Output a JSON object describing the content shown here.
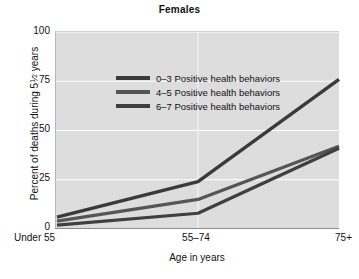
{
  "chart_data": {
    "type": "line",
    "title": "Females",
    "xlabel": "Age in years",
    "ylabel": "Percent of deaths during 5 1/2 years",
    "ylabel_prefix": "Percent of deaths during 5",
    "ylabel_frac_num": "1",
    "ylabel_frac_den": "2",
    "ylabel_suffix": " years",
    "categories": [
      "Under 55",
      "55–74",
      "75+"
    ],
    "ylim": [
      0,
      100
    ],
    "yticks": [
      0,
      25,
      50,
      75,
      100
    ],
    "ytick_labels": [
      "0",
      "25",
      "50",
      "75",
      "100"
    ],
    "grid": "horizontal-white",
    "legend_position": "upper-left-inside",
    "series": [
      {
        "name": "0–3 Positive health behaviors",
        "color": "#3a3a3a",
        "values": [
          6,
          24,
          76
        ]
      },
      {
        "name": "4–5 Positive health behaviors",
        "color": "#555555",
        "values": [
          4,
          15,
          42
        ]
      },
      {
        "name": "6–7 Positive health behaviors",
        "color": "#3f3f3f",
        "values": [
          2,
          8,
          41
        ]
      }
    ]
  },
  "style": {
    "plot_background": "#dddddd",
    "gridline_color": "#ffffff",
    "axis_color": "#8c8c8c",
    "text_color": "#111111",
    "page_background": "#ffffff"
  }
}
